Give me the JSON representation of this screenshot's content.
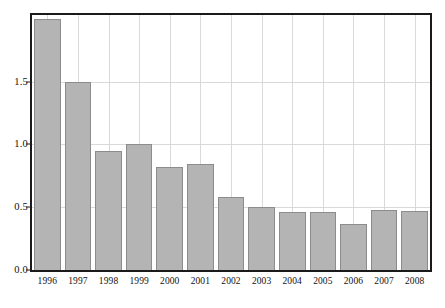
{
  "chart_data": {
    "type": "bar",
    "title": "",
    "subtitle": "",
    "xlabel": "",
    "ylabel": "",
    "categories": [
      "1996",
      "1997",
      "1998",
      "1999",
      "2000",
      "2001",
      "2002",
      "2003",
      "2004",
      "2005",
      "2006",
      "2007",
      "2008"
    ],
    "values": [
      2.0,
      1.5,
      0.95,
      1.0,
      0.82,
      0.84,
      0.58,
      0.5,
      0.46,
      0.46,
      0.37,
      0.48,
      0.47
    ],
    "ylim": [
      0.0,
      2.03
    ],
    "yticks": [
      0.0,
      0.5,
      1.0,
      1.5
    ],
    "ytick_labels": [
      "0.0",
      "0.5",
      "1.0",
      "1.5"
    ],
    "xtick_labels": [
      "1996",
      "1997",
      "1998",
      "1999",
      "2000",
      "2001",
      "2002",
      "2003",
      "2004",
      "2005",
      "2006",
      "2007",
      "2008"
    ],
    "grid": true,
    "grid_axis": "both",
    "legend": null,
    "legend_position": "none",
    "annotations": [],
    "colors": {
      "bar_fill": "#b4b4b4",
      "bar_edge": "#8c8c8c",
      "grid": "#d9d9d9",
      "frame": "#1a1a1a",
      "text": "#111111",
      "background": "#ffffff"
    },
    "bar_width_fraction": 0.87
  }
}
